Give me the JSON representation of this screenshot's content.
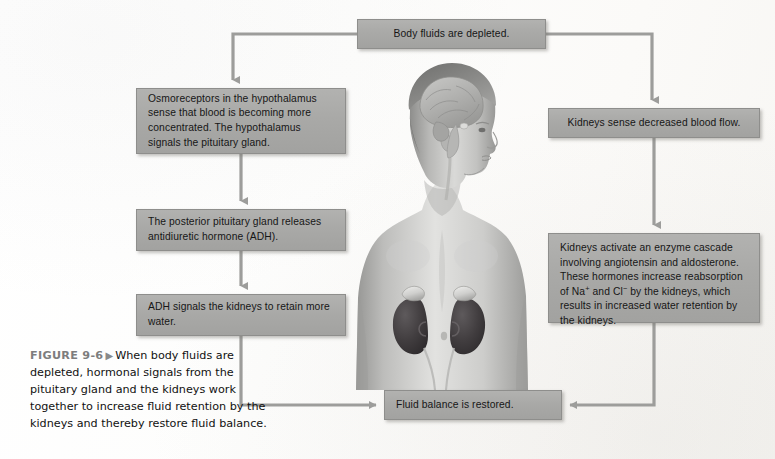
{
  "figure": {
    "label": "FIGURE 9-6",
    "marker": "triangle-right-icon",
    "caption": "When body fluids are depleted, hormonal signals from the pituitary gland and the kidneys work together to increase fluid retention by the kidneys and thereby restore fluid balance."
  },
  "colors": {
    "box_fill": "#a9a9a7",
    "box_border": "#8e8e8c",
    "connector": "#9d9d9b",
    "page_background": "#ffffff",
    "caption_label": "#7d7d7d",
    "body_text": "#161616"
  },
  "flowchart": {
    "type": "process-flow-diagram",
    "title": "Hormonal response to body fluid depletion",
    "nodes": [
      {
        "id": "depleted",
        "label": "Body fluids are depleted."
      },
      {
        "id": "osmo",
        "label": "Osmoreceptors in the hypothalamus sense that blood is becoming more concentrated.  The  hypothalamus signals the pituitary gland."
      },
      {
        "id": "posterior",
        "label": "The posterior pituitary gland releases antidiuretic hormone (ADH)."
      },
      {
        "id": "adh",
        "label": "ADH signals the kidneys to retain more water."
      },
      {
        "id": "sense",
        "label": "Kidneys sense decreased blood flow."
      },
      {
        "id": "cascade_part1",
        "label": "Kidneys activate an enzyme cascade involving angiotensin and aldosterone. These hormones increase reabsorption of Na"
      },
      {
        "id": "cascade_sup1",
        "label": "+"
      },
      {
        "id": "cascade_part2",
        "label": " and Cl"
      },
      {
        "id": "cascade_sup2",
        "label": "−"
      },
      {
        "id": "cascade_part3",
        "label": " by the kidneys, which results in increased water retention by the kidneys."
      },
      {
        "id": "balance",
        "label": "Fluid balance is restored."
      }
    ],
    "edges": [
      {
        "from": "depleted",
        "to": "osmo",
        "style": "elbow-left-down"
      },
      {
        "from": "depleted",
        "to": "sense",
        "style": "elbow-right-down"
      },
      {
        "from": "osmo",
        "to": "posterior",
        "style": "straight-down"
      },
      {
        "from": "posterior",
        "to": "adh",
        "style": "straight-down"
      },
      {
        "from": "sense",
        "to": "cascade",
        "style": "straight-down"
      },
      {
        "from": "adh",
        "to": "balance",
        "style": "elbow-down-right"
      },
      {
        "from": "cascade",
        "to": "balance",
        "style": "elbow-down-left"
      }
    ]
  },
  "illustration": {
    "name": "human-figure-anatomy",
    "description": "Grayscale anatomical illustration of a human upper body in profile showing the brain within the head and both kidneys with adrenal glands in the abdomen.",
    "parts": [
      {
        "name": "brain",
        "label": "brain"
      },
      {
        "name": "head",
        "label": "head in profile"
      },
      {
        "name": "torso",
        "label": "torso"
      },
      {
        "name": "kidneys",
        "label": "kidneys"
      },
      {
        "name": "adrenal-glands",
        "label": "adrenal glands"
      },
      {
        "name": "ureters",
        "label": "ureters"
      }
    ]
  }
}
